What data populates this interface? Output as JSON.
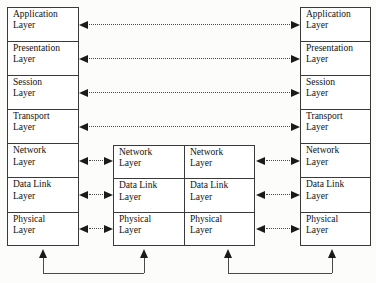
{
  "diagram": {
    "type": "network-layer-stack-diagram",
    "colors": {
      "box_border": "#3a3a3a",
      "box_fill": "#ffffff",
      "arrow": "#1a1a1a",
      "dotted_line": "#4a4a4a",
      "page_background": "#fcfcfa",
      "text": "#111111"
    },
    "stacks": {
      "left": {
        "name": "End System A",
        "layers": [
          {
            "line1": "Application",
            "line2": "Layer"
          },
          {
            "line1": "Presentation",
            "line2": "Layer"
          },
          {
            "line1": "Session",
            "line2": "Layer"
          },
          {
            "line1": "Transport",
            "line2": "Layer"
          },
          {
            "line1": "Network",
            "line2": "Layer"
          },
          {
            "line1": "Data Link",
            "line2": "Layer"
          },
          {
            "line1": "Physical",
            "line2": "Layer"
          }
        ]
      },
      "mid_left": {
        "name": "Intermediate Node A",
        "layers": [
          {
            "line1": "Network",
            "line2": "Layer"
          },
          {
            "line1": "Data Link",
            "line2": "Layer"
          },
          {
            "line1": "Physical",
            "line2": "Layer"
          }
        ]
      },
      "mid_right": {
        "name": "Intermediate Node B",
        "layers": [
          {
            "line1": "Network",
            "line2": "Layer"
          },
          {
            "line1": "Data Link",
            "line2": "Layer"
          },
          {
            "line1": "Physical",
            "line2": "Layer"
          }
        ]
      },
      "right": {
        "name": "End System B",
        "layers": [
          {
            "line1": "Application",
            "line2": "Layer"
          },
          {
            "line1": "Presentation",
            "line2": "Layer"
          },
          {
            "line1": "Session",
            "line2": "Layer"
          },
          {
            "line1": "Transport",
            "line2": "Layer"
          },
          {
            "line1": "Network",
            "line2": "Layer"
          },
          {
            "line1": "Data Link",
            "line2": "Layer"
          },
          {
            "line1": "Physical",
            "line2": "Layer"
          }
        ]
      }
    },
    "peer_connections": {
      "style": "bidirectional-dotted",
      "end_to_end": [
        {
          "layer": "Application",
          "from": "left",
          "to": "right"
        },
        {
          "layer": "Presentation",
          "from": "left",
          "to": "right"
        },
        {
          "layer": "Session",
          "from": "left",
          "to": "right"
        },
        {
          "layer": "Transport",
          "from": "left",
          "to": "right"
        }
      ],
      "hop_by_hop": [
        {
          "layer": "Network",
          "from": "left",
          "to": "mid_left"
        },
        {
          "layer": "Data Link",
          "from": "left",
          "to": "mid_left"
        },
        {
          "layer": "Physical",
          "from": "left",
          "to": "mid_left"
        },
        {
          "layer": "Network",
          "from": "mid_right",
          "to": "right"
        },
        {
          "layer": "Data Link",
          "from": "mid_right",
          "to": "right"
        },
        {
          "layer": "Physical",
          "from": "mid_right",
          "to": "right"
        }
      ]
    },
    "physical_media_links": [
      {
        "from": "left-physical",
        "to": "mid-left-physical",
        "style": "solid-u-connector-double-arrow"
      },
      {
        "from": "mid-right-physical",
        "to": "right-physical",
        "style": "solid-u-connector-double-arrow"
      }
    ]
  }
}
